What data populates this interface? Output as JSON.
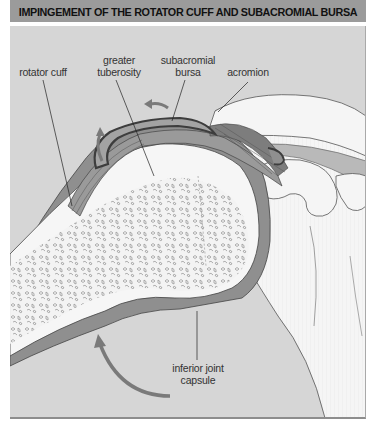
{
  "figure": {
    "title": "IMPINGEMENT OF THE ROTATOR CUFF AND SUBACROMIAL BURSA",
    "labels": {
      "rotator_cuff": "rotator cuff",
      "greater_tuberosity_1": "greater",
      "greater_tuberosity_2": "tuberosity",
      "subacromial_bursa_1": "subacromial",
      "subacromial_bursa_2": "bursa",
      "acromion": "acromion",
      "inferior_joint_capsule_1": "inferior joint",
      "inferior_joint_capsule_2": "capsule"
    },
    "colors": {
      "background": "#d6d6d6",
      "title_bar": "#9b9b9b",
      "bone": "#f3f3f3",
      "soft_tissue": "#8f8f8f",
      "bursa_outline": "#555555",
      "arrow": "#7a7a7a"
    }
  }
}
